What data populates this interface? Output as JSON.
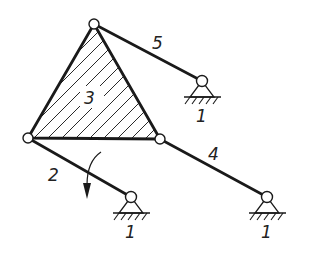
{
  "diagram": {
    "type": "planar linkage mechanism",
    "colors": {
      "line": "#1a1a1a",
      "background": "#ffffff"
    },
    "links": [
      {
        "id": "2",
        "label": "2",
        "from": "A",
        "to": "O2",
        "note": "driving crank with rotation arrow"
      },
      {
        "id": "3",
        "label": "3",
        "shape": "hatched triangle",
        "vertices": [
          "A",
          "B",
          "C"
        ]
      },
      {
        "id": "4",
        "label": "4",
        "from": "C",
        "to": "O4"
      },
      {
        "id": "5",
        "label": "5",
        "from": "B",
        "to": "O5"
      }
    ],
    "supports": [
      {
        "id": "O5",
        "label": "1"
      },
      {
        "id": "O2",
        "label": "1"
      },
      {
        "id": "O4",
        "label": "1"
      }
    ],
    "labels": {
      "link2": "2",
      "link3": "3",
      "link4": "4",
      "link5": "5",
      "ground_o5": "1",
      "ground_o2": "1",
      "ground_o4": "1"
    },
    "rotation_arrow": {
      "on_link": "2",
      "direction": "clockwise-down"
    }
  }
}
